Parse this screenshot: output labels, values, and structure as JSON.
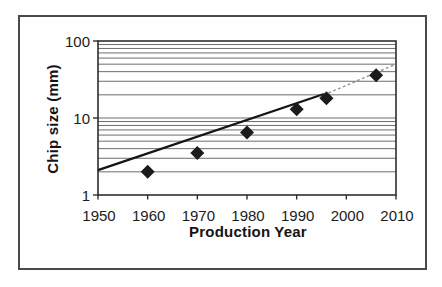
{
  "figure": {
    "frame_color": "#4a4a4a",
    "background": "#ffffff"
  },
  "chart_data": {
    "type": "scatter",
    "title": "",
    "xlabel": "Production Year",
    "ylabel": "Chip size (mm)",
    "x_range": [
      1950,
      2010
    ],
    "y_range": [
      1,
      100
    ],
    "y_scale": "log",
    "x_ticks": [
      "1950",
      "1960",
      "1970",
      "1980",
      "1990",
      "2000",
      "2010"
    ],
    "y_ticks": [
      "1",
      "10",
      "100"
    ],
    "grid": "horizontal log gridlines at 2-9, 10, 20-90",
    "legend": "none",
    "gridline_color": "#6e6e6e",
    "axis_color": "#2e2e2e",
    "series": [
      {
        "name": "chip-size-data-points",
        "marker": "diamond",
        "color": "#1b1b1b",
        "points": [
          [
            1960,
            2
          ],
          [
            1970,
            3.5
          ],
          [
            1980,
            6.5
          ],
          [
            1990,
            13
          ],
          [
            1996,
            18
          ],
          [
            2006,
            36
          ]
        ]
      }
    ],
    "trend_lines": [
      {
        "name": "solid-fit",
        "style": "solid",
        "color": "#151515",
        "from": [
          1950,
          2.1
        ],
        "to": [
          1995.5,
          20.5
        ]
      },
      {
        "name": "dotted-extrapolation",
        "style": "dotted",
        "color": "#8c8c8c",
        "from": [
          1994.5,
          18.7
        ],
        "to": [
          2010,
          50
        ]
      }
    ]
  }
}
